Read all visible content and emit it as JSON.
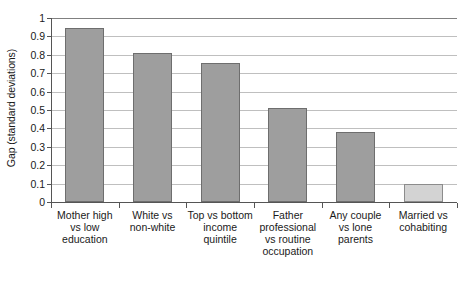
{
  "chart_data": {
    "type": "bar",
    "title": "",
    "xlabel": "",
    "ylabel": "Gap (standard deviations)",
    "ylim": [
      0,
      1
    ],
    "ytick_labels": [
      "1",
      "0.9",
      "0.8",
      "0.7",
      "0.6",
      "0.5",
      "0.4",
      "0.3",
      "0.2",
      "0.1",
      "0"
    ],
    "ytick_values": [
      1,
      0.9,
      0.8,
      0.7,
      0.6,
      0.5,
      0.4,
      0.3,
      0.2,
      0.1,
      0
    ],
    "grid": true,
    "legend": "none",
    "categories": [
      "Mother high vs low education",
      "White vs non-white",
      "Top vs bottom income quintile",
      "Father professional vs routine occupation",
      "Any couple vs lone parents",
      "Married vs cohabiting"
    ],
    "category_lines": [
      [
        "Mother high",
        "vs low",
        "education"
      ],
      [
        "White vs",
        "non-white"
      ],
      [
        "Top vs bottom",
        "income",
        "quintile"
      ],
      [
        "Father",
        "professional",
        "vs routine",
        "occupation"
      ],
      [
        "Any couple",
        "vs lone",
        "parents"
      ],
      [
        "Married vs",
        "cohabiting"
      ]
    ],
    "values": [
      0.945,
      0.81,
      0.755,
      0.51,
      0.38,
      0.1
    ],
    "bar_colors": [
      "#9e9e9e",
      "#9e9e9e",
      "#9e9e9e",
      "#9e9e9e",
      "#9e9e9e",
      "#d3d3d3"
    ],
    "bar_border_colors": [
      "#6e6e6e",
      "#6e6e6e",
      "#6e6e6e",
      "#6e6e6e",
      "#6e6e6e",
      "#8c8c8c"
    ]
  },
  "style": {
    "gridline_color": "#bfbfbf",
    "top_gridline_color": "#808080",
    "axis_color": "#555555",
    "background": "#ffffff",
    "text_color": "#1a1a1a"
  }
}
